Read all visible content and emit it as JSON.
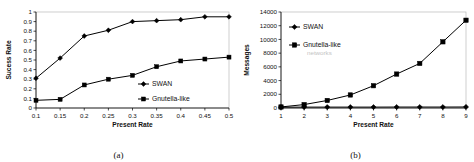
{
  "figure": {
    "panels": [
      {
        "caption": "(a)",
        "name": "success-rate-chart"
      },
      {
        "caption": "(b)",
        "name": "messages-chart"
      }
    ]
  },
  "chart_data": [
    {
      "type": "line",
      "title": "",
      "xlabel": "Present Rate",
      "ylabel": "Sucess Rate",
      "categories": [
        "0.1",
        "0.15",
        "0.2",
        "0.25",
        "0.3",
        "0.35",
        "0.4",
        "0.45",
        "0.5"
      ],
      "x": [
        0.1,
        0.15,
        0.2,
        0.25,
        0.3,
        0.35,
        0.4,
        0.45,
        0.5
      ],
      "xlim": [
        0.1,
        0.5
      ],
      "ylim": [
        0,
        1
      ],
      "yticks": [
        "0",
        "0.1",
        "0.2",
        "0.3",
        "0.4",
        "0.5",
        "0.6",
        "0.7",
        "0.8",
        "0.9",
        "1"
      ],
      "grid": false,
      "legend_position": "inside-right",
      "series": [
        {
          "name": "SWAN",
          "marker": "diamond",
          "values": [
            0.31,
            0.52,
            0.75,
            0.81,
            0.9,
            0.91,
            0.92,
            0.95,
            0.95
          ]
        },
        {
          "name": "Gnutella-like",
          "marker": "square",
          "values": [
            0.08,
            0.09,
            0.24,
            0.3,
            0.34,
            0.43,
            0.49,
            0.51,
            0.53
          ]
        }
      ]
    },
    {
      "type": "line",
      "title": "",
      "xlabel": "Present Rate",
      "ylabel": "Messages",
      "categories": [
        "1",
        "2",
        "3",
        "4",
        "5",
        "6",
        "7",
        "8",
        "9"
      ],
      "x": [
        1,
        2,
        3,
        4,
        5,
        6,
        7,
        8,
        9
      ],
      "xlim": [
        1,
        9
      ],
      "ylim": [
        0,
        14000
      ],
      "yticks": [
        "0",
        "2000",
        "4000",
        "6000",
        "8000",
        "10000",
        "12000",
        "14000"
      ],
      "grid": false,
      "legend_position": "inside-top-left",
      "legend_extra_line": "networks",
      "series": [
        {
          "name": "SWAN",
          "marker": "diamond",
          "values": [
            120,
            130,
            130,
            130,
            130,
            140,
            140,
            140,
            150
          ]
        },
        {
          "name": "Gnutella-like",
          "marker": "square",
          "values": [
            150,
            500,
            1100,
            1900,
            3250,
            4950,
            6500,
            9650,
            12800
          ]
        }
      ]
    }
  ]
}
